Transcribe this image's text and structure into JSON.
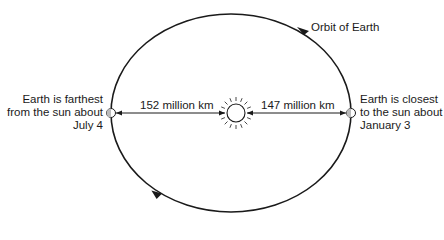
{
  "diagram": {
    "orbit_label": "Orbit of Earth",
    "aphelion": {
      "lines": [
        "Earth is farthest",
        "from the sun about",
        "July 4"
      ],
      "distance": "152 million km"
    },
    "perihelion": {
      "lines": [
        "Earth is closest",
        "to the sun about",
        "January 3"
      ],
      "distance": "147 million km"
    },
    "colors": {
      "line": "#1a1a1a",
      "background": "#ffffff"
    }
  }
}
